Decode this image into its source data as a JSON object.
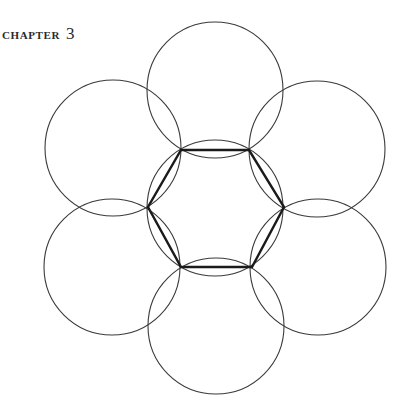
{
  "header": {
    "label": "CHAPTER",
    "number": "3"
  },
  "figure": {
    "stroke_color": "#3a3a3a",
    "hexagon_color": "#1a1a1a",
    "center": [
      215,
      208
    ],
    "radius": 68,
    "outer_circle_count": 6
  }
}
